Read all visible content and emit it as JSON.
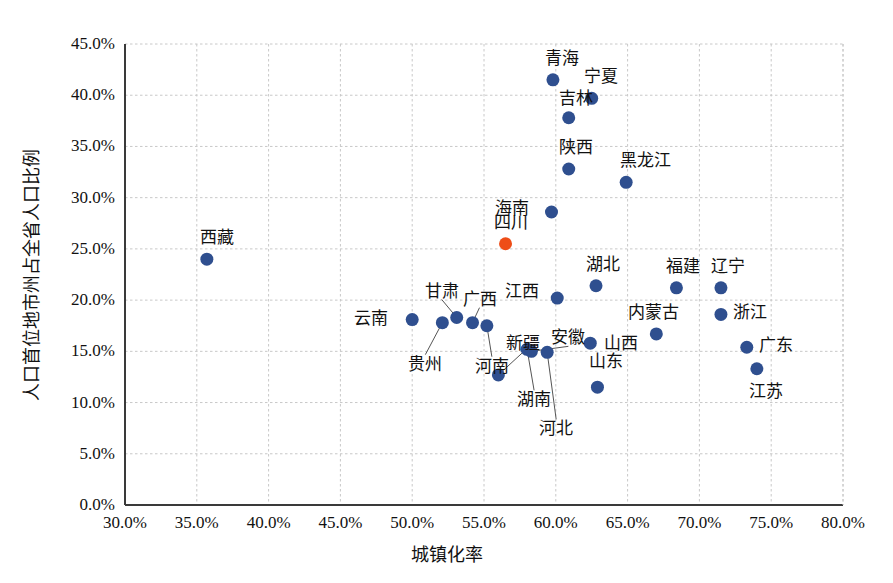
{
  "chart_data": {
    "type": "scatter",
    "title": "",
    "xlabel": "城镇化率",
    "ylabel": "人口首位地市州占全省人口比例",
    "xlim": [
      30,
      80
    ],
    "ylim": [
      0,
      45
    ],
    "xticks": [
      "30.0%",
      "35.0%",
      "40.0%",
      "45.0%",
      "50.0%",
      "55.0%",
      "60.0%",
      "65.0%",
      "70.0%",
      "75.0%",
      "80.0%"
    ],
    "yticks": [
      "0.0%",
      "5.0%",
      "10.0%",
      "15.0%",
      "20.0%",
      "25.0%",
      "30.0%",
      "35.0%",
      "40.0%",
      "45.0%"
    ],
    "xtick_values": [
      30,
      35,
      40,
      45,
      50,
      55,
      60,
      65,
      70,
      75,
      80
    ],
    "ytick_values": [
      0,
      5,
      10,
      15,
      20,
      25,
      30,
      35,
      40,
      45
    ],
    "grid": true,
    "legend": "none",
    "point_color": "#2f4f8f",
    "highlight_color": "#ee4d17",
    "grid_color": "#c8c8c8",
    "axis_color": "#3a3a3a",
    "points": [
      {
        "name": "西藏",
        "x": 35.7,
        "y": 24.0,
        "highlight": false,
        "label_dx": -7,
        "label_dy": -30,
        "leader": false
      },
      {
        "name": "云南",
        "x": 50.0,
        "y": 18.1,
        "highlight": false,
        "label_dx": -58,
        "label_dy": -10,
        "leader": false
      },
      {
        "name": "贵州",
        "x": 52.1,
        "y": 17.8,
        "highlight": false,
        "label_dx": -34,
        "label_dy": 33,
        "leader": true
      },
      {
        "name": "甘肃",
        "x": 53.1,
        "y": 18.3,
        "highlight": false,
        "label_dx": -32,
        "label_dy": -35,
        "leader": true
      },
      {
        "name": "广西",
        "x": 54.2,
        "y": 17.8,
        "highlight": false,
        "label_dx": -10,
        "label_dy": -32,
        "leader": true
      },
      {
        "name": "河南",
        "x": 55.2,
        "y": 17.5,
        "highlight": false,
        "label_dx": -12,
        "label_dy": 32,
        "leader": true
      },
      {
        "name": "新疆",
        "x": 56.0,
        "y": 12.7,
        "highlight": false,
        "label_dx": 8,
        "label_dy": -40,
        "leader": true
      },
      {
        "name": "四川",
        "x": 56.5,
        "y": 25.5,
        "highlight": true,
        "label_dx": -12,
        "label_dy": -30,
        "leader": false
      },
      {
        "name": "湖南",
        "x": 58.0,
        "y": 15.2,
        "highlight": false,
        "label_dx": -10,
        "label_dy": 42,
        "leader": true
      },
      {
        "name": "安徽",
        "x": 58.3,
        "y": 15.0,
        "highlight": false,
        "label_dx": 20,
        "label_dy": -22,
        "leader": true
      },
      {
        "name": "河北",
        "x": 59.4,
        "y": 14.9,
        "highlight": false,
        "label_dx": -8,
        "label_dy": 68,
        "leader": true
      },
      {
        "name": "江西",
        "x": 60.1,
        "y": 20.2,
        "highlight": false,
        "label_dx": -52,
        "label_dy": -15,
        "leader": false
      },
      {
        "name": "海南",
        "x": 59.7,
        "y": 28.6,
        "highlight": false,
        "label_dx": -56,
        "label_dy": -12,
        "leader": false
      },
      {
        "name": "青海",
        "x": 59.8,
        "y": 41.5,
        "highlight": false,
        "label_dx": -8,
        "label_dy": -30,
        "leader": false
      },
      {
        "name": "吉林",
        "x": 60.9,
        "y": 37.8,
        "highlight": false,
        "label_dx": -10,
        "label_dy": -28,
        "leader": false
      },
      {
        "name": "陕西",
        "x": 60.9,
        "y": 32.8,
        "highlight": false,
        "label_dx": -10,
        "label_dy": -30,
        "leader": false
      },
      {
        "name": "宁夏",
        "x": 62.5,
        "y": 39.7,
        "highlight": false,
        "label_dx": -8,
        "label_dy": -30,
        "leader": false
      },
      {
        "name": "湖北",
        "x": 62.8,
        "y": 21.4,
        "highlight": false,
        "label_dx": -10,
        "label_dy": -30,
        "leader": false
      },
      {
        "name": "山西",
        "x": 62.4,
        "y": 15.8,
        "highlight": false,
        "label_dx": 14,
        "label_dy": -8,
        "leader": false
      },
      {
        "name": "山东",
        "x": 62.9,
        "y": 11.5,
        "highlight": false,
        "label_dx": -8,
        "label_dy": -34,
        "leader": false
      },
      {
        "name": "黑龙江",
        "x": 64.9,
        "y": 31.5,
        "highlight": false,
        "label_dx": -6,
        "label_dy": -30,
        "leader": false
      },
      {
        "name": "内蒙古",
        "x": 67.0,
        "y": 16.7,
        "highlight": false,
        "label_dx": -28,
        "label_dy": -30,
        "leader": false
      },
      {
        "name": "福建",
        "x": 68.4,
        "y": 21.2,
        "highlight": false,
        "label_dx": -10,
        "label_dy": -30,
        "leader": false
      },
      {
        "name": "辽宁",
        "x": 71.5,
        "y": 21.2,
        "highlight": false,
        "label_dx": -10,
        "label_dy": -30,
        "leader": false
      },
      {
        "name": "浙江",
        "x": 71.5,
        "y": 18.6,
        "highlight": false,
        "label_dx": 12,
        "label_dy": -10,
        "leader": false
      },
      {
        "name": "广东",
        "x": 73.3,
        "y": 15.4,
        "highlight": false,
        "label_dx": 12,
        "label_dy": -10,
        "leader": false
      },
      {
        "name": "江苏",
        "x": 74.0,
        "y": 13.3,
        "highlight": false,
        "label_dx": -8,
        "label_dy": 14,
        "leader": false
      }
    ]
  }
}
